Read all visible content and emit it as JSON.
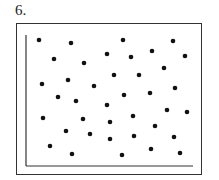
{
  "problem_label": "6.",
  "chart_data": {
    "type": "scatter",
    "title": "",
    "xlabel": "",
    "ylabel": "",
    "grid": false,
    "legend": null,
    "note": "Unlabeled axes; coordinates given in pixel space of plot (x right, y down from image top-left), showing no correlation",
    "axes": {
      "origin": [
        26,
        166
      ],
      "x_end": [
        193,
        166
      ],
      "y_end": [
        26,
        35
      ]
    },
    "points": [
      [
        39,
        40
      ],
      [
        71,
        43
      ],
      [
        123,
        40
      ],
      [
        173,
        41
      ],
      [
        54,
        59
      ],
      [
        84,
        63
      ],
      [
        107,
        54
      ],
      [
        131,
        57
      ],
      [
        152,
        51
      ],
      [
        185,
        56
      ],
      [
        164,
        68
      ],
      [
        114,
        75
      ],
      [
        139,
        75
      ],
      [
        68,
        80
      ],
      [
        42,
        84
      ],
      [
        94,
        86
      ],
      [
        175,
        88
      ],
      [
        58,
        97
      ],
      [
        124,
        95
      ],
      [
        150,
        93
      ],
      [
        76,
        101
      ],
      [
        107,
        105
      ],
      [
        167,
        110
      ],
      [
        187,
        112
      ],
      [
        43,
        118
      ],
      [
        83,
        119
      ],
      [
        133,
        116
      ],
      [
        110,
        122
      ],
      [
        155,
        126
      ],
      [
        66,
        131
      ],
      [
        90,
        134
      ],
      [
        134,
        136
      ],
      [
        110,
        139
      ],
      [
        174,
        137
      ],
      [
        50,
        146
      ],
      [
        151,
        149
      ],
      [
        72,
        154
      ],
      [
        180,
        153
      ],
      [
        122,
        155
      ]
    ]
  },
  "colors": {
    "ink": "#111111",
    "frame": "#333333"
  }
}
